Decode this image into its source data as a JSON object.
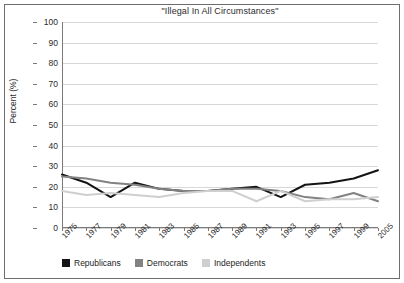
{
  "chart_data": {
    "type": "line",
    "title": "\"Illegal In All Circumstances\"",
    "xlabel": "",
    "ylabel": "Percent (%)",
    "ylim": [
      0,
      100
    ],
    "ytick_step": 10,
    "grid": true,
    "legend_position": "bottom-left",
    "categories": [
      "1975",
      "1977",
      "1979",
      "1981",
      "1983",
      "1985",
      "1987",
      "1989",
      "1991",
      "1993",
      "1995",
      "1997",
      "1999",
      "2005"
    ],
    "yticks": [
      "100",
      "90",
      "80",
      "70",
      "60",
      "50",
      "40",
      "30",
      "20",
      "10",
      "0"
    ],
    "series": [
      {
        "name": "Republicans",
        "color": "#141414",
        "values": [
          26,
          22,
          15,
          22,
          19,
          18,
          18,
          19,
          20,
          15,
          21,
          22,
          24,
          28
        ]
      },
      {
        "name": "Democrats",
        "color": "#828282",
        "values": [
          25,
          24,
          22,
          21,
          19,
          18,
          18,
          19,
          19,
          18,
          15,
          14,
          17,
          13
        ]
      },
      {
        "name": "Independents",
        "color": "#cfcfcf",
        "values": [
          18,
          16,
          17,
          16,
          15,
          17,
          18,
          18,
          13,
          18,
          13,
          14,
          14,
          15
        ]
      }
    ]
  },
  "legend": {
    "items": [
      {
        "label": "Republicans",
        "color": "#141414"
      },
      {
        "label": "Democrats",
        "color": "#828282"
      },
      {
        "label": "Independents",
        "color": "#cfcfcf"
      }
    ]
  }
}
